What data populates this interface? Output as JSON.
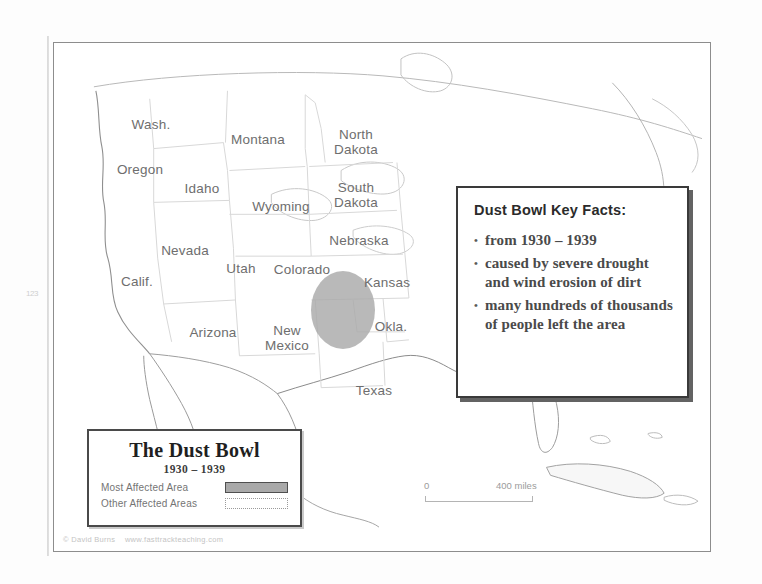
{
  "map": {
    "frame_border_color": "#8d8d8d",
    "background_color": "#ffffff",
    "scan_mark": "123",
    "state_labels": [
      {
        "name": "Wash.",
        "text": "Wash.",
        "x": 97,
        "y": 82
      },
      {
        "name": "Montana",
        "text": "Montana",
        "x": 204,
        "y": 97
      },
      {
        "name": "North-Dakota",
        "text": "North\nDakota",
        "x": 302,
        "y": 99
      },
      {
        "name": "Oregon",
        "text": "Oregon",
        "x": 86,
        "y": 127
      },
      {
        "name": "Idaho",
        "text": "Idaho",
        "x": 148,
        "y": 146
      },
      {
        "name": "South-Dakota",
        "text": "South\nDakota",
        "x": 302,
        "y": 152
      },
      {
        "name": "Wyoming",
        "text": "Wyoming",
        "x": 227,
        "y": 164
      },
      {
        "name": "Nebraska",
        "text": "Nebraska",
        "x": 305,
        "y": 198
      },
      {
        "name": "Nevada",
        "text": "Nevada",
        "x": 131,
        "y": 208
      },
      {
        "name": "Utah",
        "text": "Utah",
        "x": 187,
        "y": 226
      },
      {
        "name": "Colorado",
        "text": "Colorado",
        "x": 248,
        "y": 227
      },
      {
        "name": "Calif.",
        "text": "Calif.",
        "x": 83,
        "y": 239
      },
      {
        "name": "Kansas",
        "text": "Kansas",
        "x": 333,
        "y": 240
      },
      {
        "name": "Arizona",
        "text": "Arizona",
        "x": 159,
        "y": 290
      },
      {
        "name": "New-Mexico",
        "text": "New\nMexico",
        "x": 233,
        "y": 295
      },
      {
        "name": "Okla.",
        "text": "Okla.",
        "x": 337,
        "y": 284
      },
      {
        "name": "Texas",
        "text": "Texas",
        "x": 320,
        "y": 348
      }
    ]
  },
  "dustbowl_area": {
    "label": "most-affected-dustbowl-ellipse",
    "color": "#a9a9a9"
  },
  "keyfacts": {
    "title": "Dust Bowl Key Facts:",
    "bullet": "•",
    "items": [
      "from 1930 – 1939",
      "caused by severe drought and wind erosion of dirt",
      "many hundreds of thousands of people left the area"
    ]
  },
  "legend": {
    "title": "The Dust Bowl",
    "years": "1930 – 1939",
    "entries": [
      {
        "label": "Most Affected Area",
        "swatch": "solid-gray"
      },
      {
        "label": "Other Affected Areas",
        "swatch": "white-dotted"
      }
    ]
  },
  "scale": {
    "zero": "0",
    "max": "400 miles"
  },
  "copyright": "© David Burns    www.fasttrackteaching.com"
}
